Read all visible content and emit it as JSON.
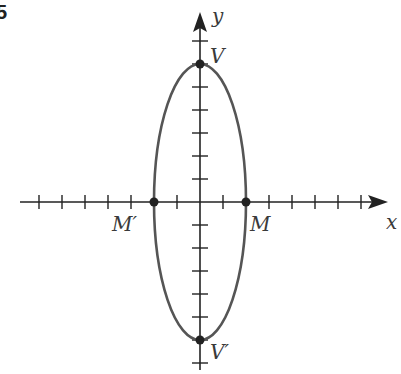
{
  "figure": {
    "number_fragment": "5"
  },
  "axes": {
    "x_label": "x",
    "y_label": "y",
    "tick_spacing_px": 23,
    "x_ticks": [
      -7,
      -6,
      -5,
      -4,
      -3,
      -2,
      -1,
      1,
      2,
      3,
      4,
      5,
      6,
      7
    ],
    "y_ticks": [
      7,
      6,
      5,
      4,
      3,
      2,
      1,
      -1,
      -2,
      -3,
      -4,
      -5,
      -6,
      -7
    ]
  },
  "ellipse": {
    "center": [
      0,
      0
    ],
    "semi_major_vertical": 6,
    "semi_minor_horizontal": 2,
    "stroke_color": "#555555"
  },
  "points": [
    {
      "name": "V",
      "label": "V",
      "x": 0,
      "y": 6
    },
    {
      "name": "V-prime",
      "label": "V′",
      "x": 0,
      "y": -6
    },
    {
      "name": "M",
      "label": "M",
      "x": 2,
      "y": 0
    },
    {
      "name": "M-prime",
      "label": "M′",
      "x": -2,
      "y": 0
    }
  ],
  "colors": {
    "axis": "#222222",
    "curve": "#555555",
    "label": "#3a3a3a"
  }
}
